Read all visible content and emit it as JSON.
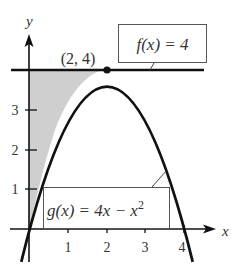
{
  "diagram": {
    "type": "function-graph",
    "axes": {
      "x_label": "x",
      "y_label": "y",
      "x_ticks": [
        "1",
        "2",
        "3",
        "4"
      ],
      "y_ticks": [
        "1",
        "2",
        "3"
      ]
    },
    "curves": [
      {
        "name": "g",
        "expression": "4x - x^2",
        "label_prefix": "g(x) = 4x − x",
        "label_exp": "2"
      },
      {
        "name": "f",
        "expression": "4",
        "label": "f(x) = 4"
      }
    ],
    "point": {
      "label": "(2, 4)",
      "x": 2,
      "y": 4
    },
    "shaded_region": "between f(x)=4 and g(x) for 0 ≤ x ≤ 2",
    "colors": {
      "line": "#111111",
      "shade": "#cfcfcf",
      "box_border": "#555555"
    }
  }
}
